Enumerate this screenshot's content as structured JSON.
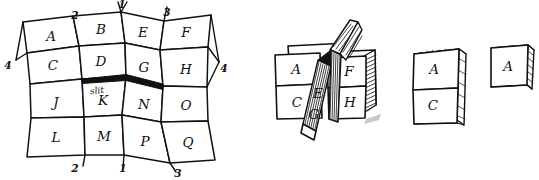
{
  "figure": {
    "background_color": "#ffffff",
    "ink_color": "#111111",
    "style": "hand-drawn pen sketch"
  },
  "grid": {
    "name": "unfolded-sheet",
    "rows": 4,
    "columns": 4,
    "cells": [
      [
        "A",
        "B",
        "E",
        "F"
      ],
      [
        "C",
        "D",
        "G",
        "H"
      ],
      [
        "J",
        "K",
        "N",
        "O"
      ],
      [
        "L",
        "M",
        "P",
        "Q"
      ]
    ],
    "slit_label": "slit",
    "slit_description": "thick black cut between row 2 and row 3, spanning cells D-G above and K-N below",
    "edge_numbers": {
      "top": [
        "2",
        "1",
        "3"
      ],
      "bottom": [
        "2",
        "1",
        "3"
      ],
      "left": [
        "4"
      ],
      "right": [
        "4"
      ]
    }
  },
  "stages": [
    {
      "name": "partially-folded",
      "visible_labels": [
        "A",
        "C",
        "E",
        "G",
        "F",
        "H"
      ],
      "caption": ""
    },
    {
      "name": "nearly-folded",
      "visible_labels": [
        "A",
        "C"
      ],
      "caption": ""
    },
    {
      "name": "fully-folded",
      "visible_labels": [
        "A"
      ],
      "caption": ""
    }
  ]
}
